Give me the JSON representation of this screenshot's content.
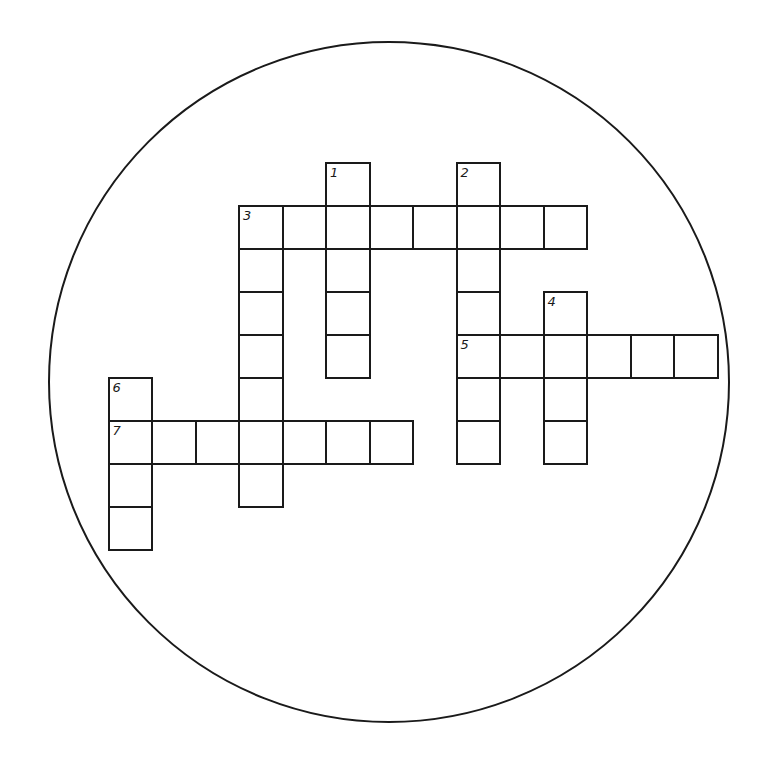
{
  "puzzle": {
    "title": "",
    "shape": "circle",
    "colors": {
      "ink": "#1a1a1a",
      "background": "#ffffff"
    },
    "grid": {
      "origin_x": 238,
      "origin_y": 205,
      "cell_w": 43.5,
      "cell_h": 43
    },
    "circle": {
      "cx": 389,
      "cy": 382,
      "r": 341
    },
    "clues": [
      {
        "number": "1",
        "direction": "down",
        "col": 2,
        "row": -1,
        "length": 5
      },
      {
        "number": "2",
        "direction": "down",
        "col": 5,
        "row": -1,
        "length": 7
      },
      {
        "number": "3",
        "direction": "across",
        "col": 0,
        "row": 0,
        "length": 8
      },
      {
        "number": "3",
        "direction": "down",
        "col": 0,
        "row": 0,
        "length": 7
      },
      {
        "number": "4",
        "direction": "down",
        "col": 7,
        "row": 2,
        "length": 4
      },
      {
        "number": "5",
        "direction": "across",
        "col": 5,
        "row": 3,
        "length": 6
      },
      {
        "number": "6",
        "direction": "down",
        "col": -3,
        "row": 4,
        "length": 4
      },
      {
        "number": "7",
        "direction": "across",
        "col": -3,
        "row": 5,
        "length": 7
      }
    ]
  }
}
